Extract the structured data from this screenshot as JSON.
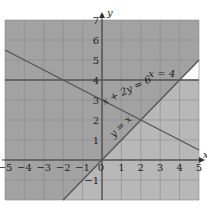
{
  "chart_data": {
    "type": "line",
    "title": "",
    "xlabel": "x",
    "ylabel": "y",
    "xlim": [
      -5,
      5
    ],
    "ylim": [
      -2,
      7
    ],
    "grid": true,
    "x_ticks": [
      -5,
      -4,
      -3,
      -2,
      -1,
      0,
      1,
      2,
      3,
      4,
      5
    ],
    "y_ticks": [
      -1,
      1,
      2,
      3,
      4,
      5,
      6,
      7
    ],
    "series": [
      {
        "name": "x = 4",
        "kind": "horizontal",
        "equation": "y = 4",
        "points": [
          [
            -5,
            4
          ],
          [
            5,
            4
          ]
        ]
      },
      {
        "name": "x + 2y = 6",
        "kind": "line",
        "equation": "x + 2y = 6",
        "points": [
          [
            -5,
            5.5
          ],
          [
            5,
            0.5
          ]
        ]
      },
      {
        "name": "y = x",
        "kind": "line",
        "equation": "y = x",
        "points": [
          [
            -2,
            -2
          ],
          [
            5,
            5
          ]
        ]
      }
    ],
    "regions": [
      {
        "name": "above y = x",
        "fill": "#a2a2a2",
        "polygon": [
          [
            -5,
            -2
          ],
          [
            -2,
            -2
          ],
          [
            5,
            5
          ],
          [
            5,
            7
          ],
          [
            -5,
            7
          ]
        ]
      },
      {
        "name": "below y = x and below y = 4",
        "fill": "#b8b8b8",
        "polygon": [
          [
            -2,
            -2
          ],
          [
            5,
            -2
          ],
          [
            5,
            4
          ],
          [
            4,
            4
          ]
        ]
      },
      {
        "name": "unshaded feasible triangle",
        "fill": "#ffffff",
        "polygon": [
          [
            4,
            4
          ],
          [
            5,
            4
          ],
          [
            5,
            5
          ]
        ]
      }
    ],
    "annotations": [
      {
        "text": "x = 4",
        "at": [
          2.4,
          4.15
        ]
      },
      {
        "text": "x + 2y = 6",
        "at": [
          0.1,
          2.75
        ],
        "rotate": -26
      },
      {
        "text": "y = x",
        "at": [
          0.6,
          1.1
        ],
        "rotate": -45
      },
      {
        "text": "0",
        "at": [
          0,
          0
        ]
      }
    ],
    "intersections": [
      [
        2,
        2
      ],
      [
        4,
        4
      ],
      [
        -2,
        4
      ]
    ]
  },
  "axes": {
    "x_label": "x",
    "y_label": "y"
  },
  "colors": {
    "line": "#555555",
    "grid": "#8a8a8a",
    "axis": "#333333"
  }
}
